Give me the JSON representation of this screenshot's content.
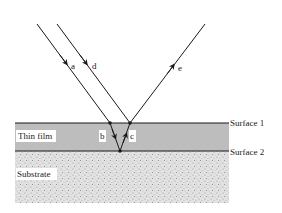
{
  "diagram": {
    "type": "thin-film-interference",
    "layers": {
      "thin_film": {
        "label": "Thin film",
        "color": "#bdbdbd"
      },
      "substrate": {
        "label": "Substrate",
        "color": "#d9d9d9"
      }
    },
    "surfaces": [
      {
        "label": "Surface 1"
      },
      {
        "label": "Surface 2"
      }
    ],
    "rays": [
      {
        "id": "a",
        "label": "a",
        "description": "incident ray"
      },
      {
        "id": "b",
        "label": "b",
        "description": "refracted into film"
      },
      {
        "id": "c",
        "label": "c",
        "description": "reflected from surface 2"
      },
      {
        "id": "d",
        "label": "d",
        "description": "incident ray"
      },
      {
        "id": "e",
        "label": "e",
        "description": "reflected ray"
      }
    ],
    "colors": {
      "line": "#1a1a1a",
      "background": "#ffffff"
    }
  }
}
